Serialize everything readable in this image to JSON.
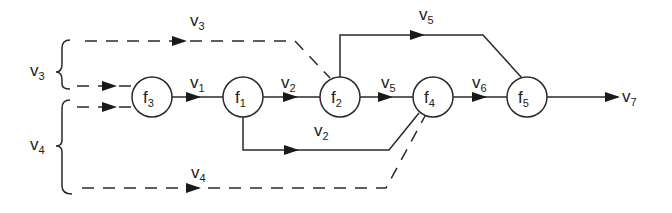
{
  "diagram": {
    "type": "signal-flow",
    "nodes": [
      {
        "id": "f3",
        "base": "f",
        "sub": "3",
        "cx": 152,
        "cy": 97
      },
      {
        "id": "f1",
        "base": "f",
        "sub": "1",
        "cx": 243,
        "cy": 97
      },
      {
        "id": "f2",
        "base": "f",
        "sub": "2",
        "cx": 340,
        "cy": 97
      },
      {
        "id": "f4",
        "base": "f",
        "sub": "4",
        "cx": 433,
        "cy": 97
      },
      {
        "id": "f5",
        "base": "f",
        "sub": "5",
        "cx": 527,
        "cy": 97
      }
    ],
    "labels": {
      "v3_top": {
        "base": "v",
        "sub": "3"
      },
      "v3_brace": {
        "base": "v",
        "sub": "3"
      },
      "v4_brace": {
        "base": "v",
        "sub": "4"
      },
      "v1": {
        "base": "v",
        "sub": "1"
      },
      "v2_main": {
        "base": "v",
        "sub": "2"
      },
      "v2_lower": {
        "base": "v",
        "sub": "2"
      },
      "v5_top": {
        "base": "v",
        "sub": "5"
      },
      "v5_main": {
        "base": "v",
        "sub": "5"
      },
      "v6": {
        "base": "v",
        "sub": "6"
      },
      "v7": {
        "base": "v",
        "sub": "7"
      },
      "v4_bottom": {
        "base": "v",
        "sub": "4"
      }
    },
    "edges": [
      {
        "from": "input-v3",
        "to": "f2",
        "label": "v3",
        "style": "dashed"
      },
      {
        "from": "input-v3",
        "to": "f3",
        "style": "dashed"
      },
      {
        "from": "input-v4",
        "to": "f3",
        "style": "dashed"
      },
      {
        "from": "f3",
        "to": "f1",
        "label": "v1",
        "style": "solid"
      },
      {
        "from": "f1",
        "to": "f2",
        "label": "v2",
        "style": "solid"
      },
      {
        "from": "f1",
        "to": "f4",
        "label": "v2",
        "style": "solid"
      },
      {
        "from": "f2",
        "to": "f4",
        "label": "v5",
        "style": "solid"
      },
      {
        "from": "f2",
        "to": "f5",
        "label": "v5",
        "style": "solid"
      },
      {
        "from": "f4",
        "to": "f5",
        "label": "v6",
        "style": "solid"
      },
      {
        "from": "input-v4",
        "to": "f4",
        "label": "v4",
        "style": "dashed"
      },
      {
        "from": "f5",
        "to": "output",
        "label": "v7",
        "style": "solid"
      }
    ],
    "colors": {
      "stroke": "#2a2a2a",
      "background": "#ffffff"
    }
  }
}
